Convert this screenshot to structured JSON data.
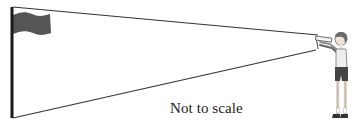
{
  "diagram": {
    "caption": "Not to scale",
    "elements": {
      "flagpole": "vertical pole with flag",
      "flag": "waving flag at top of pole",
      "sight_lines": [
        "line to top of flagpole",
        "line to bottom of flagpole"
      ],
      "observer": "boy looking through a sighting tube"
    },
    "colors": {
      "pole": "#1a1a1a",
      "flag": "#555555",
      "lines": "#333333",
      "caption": "#222222"
    }
  }
}
